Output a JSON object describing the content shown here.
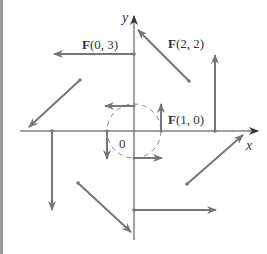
{
  "diagram": {
    "axes": {
      "x_label": "x",
      "y_label": "y",
      "origin_label": "0"
    },
    "labels": {
      "f03": {
        "bold": "F",
        "rest": "(0, 3)"
      },
      "f22": {
        "bold": "F",
        "rest": "(2, 2)"
      },
      "f10": {
        "bold": "F",
        "rest": "(1, 0)"
      }
    },
    "colors": {
      "axis": "#444444",
      "vector": "#777777",
      "circle": "#888888",
      "left_bar": "#9a9a9a"
    },
    "vectors": [
      {
        "at": [
          0,
          3
        ],
        "value": [
          -3,
          0
        ]
      },
      {
        "at": [
          2,
          2
        ],
        "value": [
          -2,
          2
        ]
      },
      {
        "at": [
          3,
          0
        ],
        "value": [
          0,
          3
        ]
      },
      {
        "at": [
          -2,
          2
        ],
        "value": [
          -2,
          -2
        ]
      },
      {
        "at": [
          -3,
          0
        ],
        "value": [
          0,
          -3
        ]
      },
      {
        "at": [
          -2,
          -2
        ],
        "value": [
          2,
          -2
        ]
      },
      {
        "at": [
          0,
          -3
        ],
        "value": [
          3,
          0
        ]
      },
      {
        "at": [
          2,
          -2
        ],
        "value": [
          2,
          2
        ]
      },
      {
        "at": [
          1,
          0
        ],
        "value": [
          0,
          1
        ]
      },
      {
        "at": [
          0,
          1
        ],
        "value": [
          -1,
          0
        ]
      },
      {
        "at": [
          -1,
          0
        ],
        "value": [
          0,
          -1
        ]
      },
      {
        "at": [
          0,
          -1
        ],
        "value": [
          1,
          0
        ]
      }
    ],
    "circle": {
      "center": [
        0,
        0
      ],
      "radius": 1,
      "style": "dashed"
    }
  }
}
